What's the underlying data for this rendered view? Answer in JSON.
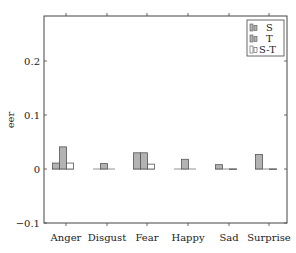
{
  "chart_data": {
    "type": "bar",
    "title": "",
    "xlabel": "",
    "ylabel": "eer",
    "ylim": [
      -0.1,
      0.28
    ],
    "yticks": [
      -0.1,
      0,
      0.1,
      0.2
    ],
    "ytick_labels": [
      "−0.1",
      "0",
      "0.1",
      "0.2"
    ],
    "grid": false,
    "legend_position": "top-right",
    "categories": [
      "Anger",
      "Disgust",
      "Fear",
      "Happy",
      "Sad",
      "Surprise"
    ],
    "series": [
      {
        "name": "S",
        "fill": "#b3b3b3",
        "stroke": "#555555",
        "values": [
          0.011,
          0.0,
          0.03,
          0.0,
          0.008,
          0.027
        ]
      },
      {
        "name": "T",
        "fill": "#b3b3b3",
        "stroke": "#555555",
        "values": [
          0.041,
          0.01,
          0.03,
          0.018,
          0.0,
          0.0
        ]
      },
      {
        "name": "S-T",
        "fill": "#ffffff",
        "stroke": "#555555",
        "values": [
          0.011,
          0.0,
          0.009,
          0.0,
          -0.001,
          -0.001
        ]
      }
    ]
  }
}
